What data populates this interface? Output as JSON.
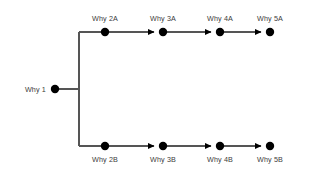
{
  "diagram": {
    "type": "five-whys-tree",
    "background_color": "#ffffff",
    "node_color": "#000000",
    "line_color": "#555555",
    "label_color": "#3b3b3b",
    "root": {
      "id": "why-1",
      "label": "Why 1",
      "x": 55,
      "y": 89,
      "label_x": 46,
      "label_y": 89
    },
    "branches": [
      {
        "id": "branch-a",
        "y": 32,
        "label_y": 14,
        "label_position": "above",
        "nodes": [
          {
            "id": "why-2a",
            "label": "Why 2A",
            "x": 105
          },
          {
            "id": "why-3a",
            "label": "Why 3A",
            "x": 163
          },
          {
            "id": "why-4a",
            "label": "Why 4A",
            "x": 220
          },
          {
            "id": "why-5a",
            "label": "Why 5A",
            "x": 270
          }
        ]
      },
      {
        "id": "branch-b",
        "y": 146,
        "label_y": 155,
        "label_position": "below",
        "nodes": [
          {
            "id": "why-2b",
            "label": "Why 2B",
            "x": 105
          },
          {
            "id": "why-3b",
            "label": "Why 3B",
            "x": 163
          },
          {
            "id": "why-4b",
            "label": "Why 4B",
            "x": 220
          },
          {
            "id": "why-5b",
            "label": "Why 5B",
            "x": 270
          }
        ]
      }
    ],
    "split_x": 79,
    "node_radius": 4.2,
    "line_width": 1.4,
    "arrow_size": 4.5
  }
}
